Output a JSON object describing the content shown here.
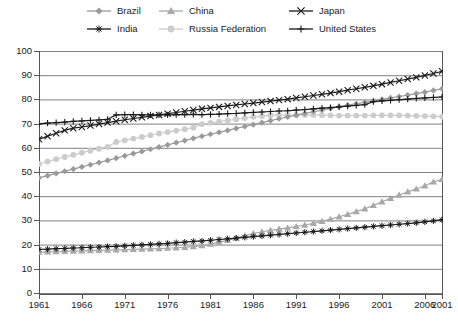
{
  "chart_data": {
    "type": "line",
    "title": "",
    "subtitle": "",
    "xlabel": "",
    "ylabel": "",
    "xlim": [
      1961,
      2008
    ],
    "ylim": [
      0,
      100
    ],
    "grid": true,
    "legend_position": "top",
    "yticks": [
      100,
      90,
      80,
      70,
      60,
      50,
      40,
      30,
      20,
      10,
      0
    ],
    "xticks": [
      "1961",
      "1966",
      "1971",
      "1976",
      "1981",
      "1986",
      "1991",
      "1996",
      "2001",
      "2006",
      "2001"
    ],
    "xtick_values": [
      1961,
      1966,
      1971,
      1976,
      1981,
      1986,
      1991,
      1996,
      2001,
      2006,
      2008
    ],
    "x": [
      1961,
      1962,
      1963,
      1964,
      1965,
      1966,
      1967,
      1968,
      1969,
      1970,
      1971,
      1972,
      1973,
      1974,
      1975,
      1976,
      1977,
      1978,
      1979,
      1980,
      1981,
      1982,
      1983,
      1984,
      1985,
      1986,
      1987,
      1988,
      1989,
      1990,
      1991,
      1992,
      1993,
      1994,
      1995,
      1996,
      1997,
      1998,
      1999,
      2000,
      2001,
      2002,
      2003,
      2004,
      2005,
      2006,
      2007,
      2008
    ],
    "series": [
      {
        "name": "Brazil",
        "marker": "diamond",
        "color": "#9a9a9a",
        "line_color": "#9a9a9a",
        "values": [
          47.6,
          48.5,
          49.4,
          50.3,
          51.2,
          52.1,
          53.0,
          53.9,
          54.8,
          55.7,
          56.7,
          57.6,
          58.5,
          59.4,
          60.3,
          61.2,
          62.1,
          63.0,
          63.9,
          64.8,
          65.6,
          66.4,
          67.2,
          68.0,
          68.8,
          69.6,
          70.4,
          71.2,
          72.0,
          72.8,
          73.5,
          74.2,
          74.9,
          75.6,
          76.3,
          77.0,
          77.6,
          78.2,
          78.8,
          79.4,
          80.0,
          80.6,
          81.2,
          81.8,
          82.4,
          83.0,
          83.7,
          84.4
        ]
      },
      {
        "name": "China",
        "marker": "triangle",
        "color": "#a8a8a8",
        "line_color": "#a8a8a8",
        "values": [
          16.9,
          17.0,
          17.1,
          17.2,
          17.3,
          17.4,
          17.5,
          17.6,
          17.7,
          17.8,
          17.9,
          18.0,
          18.1,
          18.2,
          18.3,
          18.5,
          18.7,
          18.9,
          19.2,
          19.6,
          20.2,
          21.0,
          21.8,
          22.7,
          23.7,
          24.6,
          25.3,
          25.9,
          26.4,
          26.9,
          27.5,
          28.1,
          28.8,
          29.6,
          30.5,
          31.5,
          32.5,
          33.6,
          34.8,
          36.2,
          37.7,
          39.1,
          40.5,
          41.8,
          43.0,
          44.3,
          45.9,
          47.0
        ]
      },
      {
        "name": "Japan",
        "marker": "x",
        "color": "#1a1a1a",
        "line_color": "#1a1a1a",
        "values": [
          63.5,
          64.8,
          66.0,
          67.2,
          68.1,
          68.6,
          69.2,
          69.8,
          70.4,
          71.0,
          71.6,
          72.1,
          72.6,
          73.1,
          73.6,
          74.1,
          74.6,
          75.1,
          75.6,
          76.1,
          76.5,
          76.9,
          77.3,
          77.7,
          78.1,
          78.5,
          78.9,
          79.3,
          79.7,
          80.1,
          80.6,
          81.1,
          81.6,
          82.1,
          82.6,
          83.2,
          83.8,
          84.4,
          85.0,
          85.6,
          86.3,
          87.0,
          87.7,
          88.4,
          89.1,
          89.9,
          90.7,
          91.6
        ]
      },
      {
        "name": "India",
        "marker": "star",
        "color": "#1a1a1a",
        "line_color": "#1a1a1a",
        "values": [
          18.0,
          18.1,
          18.3,
          18.4,
          18.6,
          18.7,
          18.9,
          19.0,
          19.2,
          19.3,
          19.5,
          19.7,
          19.9,
          20.1,
          20.3,
          20.5,
          20.8,
          21.0,
          21.3,
          21.5,
          21.8,
          22.1,
          22.4,
          22.7,
          23.0,
          23.3,
          23.6,
          23.9,
          24.2,
          24.5,
          24.8,
          25.1,
          25.4,
          25.7,
          26.0,
          26.3,
          26.6,
          26.9,
          27.2,
          27.5,
          27.8,
          28.1,
          28.4,
          28.7,
          29.0,
          29.4,
          29.8,
          30.3
        ]
      },
      {
        "name": "Russia Federation",
        "marker": "circle",
        "color": "#cccccc",
        "line_color": "#cccccc",
        "values": [
          53.3,
          54.3,
          55.3,
          56.2,
          57.1,
          58.0,
          58.8,
          59.6,
          60.4,
          62.4,
          63.1,
          63.8,
          64.5,
          65.2,
          65.9,
          66.5,
          67.1,
          67.7,
          68.3,
          69.8,
          70.3,
          70.8,
          71.3,
          71.8,
          72.3,
          72.8,
          73.1,
          73.4,
          73.6,
          73.4,
          73.5,
          73.6,
          73.6,
          73.5,
          73.4,
          73.3,
          73.3,
          73.3,
          73.3,
          73.4,
          73.4,
          73.4,
          73.4,
          73.3,
          73.2,
          73.1,
          73.0,
          72.9
        ]
      },
      {
        "name": "United States",
        "marker": "plus",
        "color": "#1a1a1a",
        "line_color": "#1a1a1a",
        "values": [
          69.9,
          70.2,
          70.4,
          70.6,
          70.9,
          71.1,
          71.3,
          71.5,
          71.8,
          73.6,
          73.7,
          73.7,
          73.6,
          73.6,
          73.6,
          73.6,
          73.7,
          73.7,
          73.8,
          73.7,
          73.8,
          73.9,
          74.1,
          74.2,
          74.4,
          74.6,
          74.8,
          75.0,
          75.2,
          75.3,
          75.6,
          75.8,
          76.1,
          76.4,
          76.6,
          76.9,
          77.2,
          77.5,
          77.8,
          79.1,
          79.4,
          79.6,
          79.9,
          80.1,
          80.4,
          80.6,
          80.8,
          81.0
        ]
      }
    ]
  },
  "legend": {
    "rows": [
      [
        {
          "label": "Brazil",
          "marker": "diamond",
          "color": "#9a9a9a",
          "name": "legend-item-brazil"
        },
        {
          "label": "China",
          "marker": "triangle",
          "color": "#a8a8a8",
          "name": "legend-item-china"
        },
        {
          "label": "Japan",
          "marker": "x",
          "color": "#1a1a1a",
          "name": "legend-item-japan"
        }
      ],
      [
        {
          "label": "India",
          "marker": "star",
          "color": "#1a1a1a",
          "name": "legend-item-india"
        },
        {
          "label": "Russia Federation",
          "marker": "circle",
          "color": "#cccccc",
          "name": "legend-item-russia-federation"
        },
        {
          "label": "United States",
          "marker": "plus",
          "color": "#1a1a1a",
          "name": "legend-item-united-states"
        }
      ]
    ]
  },
  "style": {
    "grid_color": "#808080",
    "axis_color": "#555555",
    "background": "#ffffff"
  }
}
